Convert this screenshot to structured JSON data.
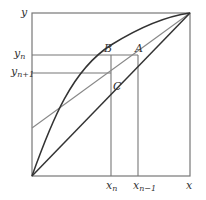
{
  "diagram": {
    "type": "McCabe-Thiele style equilibrium / operating line construction",
    "axes": {
      "x_label": "x",
      "y_label": "y"
    },
    "horizontal_levels": [
      {
        "label": "y",
        "sub": "n",
        "id": "y_n"
      },
      {
        "label": "y",
        "sub": "n+1",
        "id": "y_n_plus_1"
      }
    ],
    "vertical_levels": [
      {
        "label": "x",
        "sub": "n",
        "id": "x_n"
      },
      {
        "label": "x",
        "sub": "n−1",
        "id": "x_n_minus_1"
      }
    ],
    "points": [
      {
        "label": "A"
      },
      {
        "label": "B"
      },
      {
        "label": "C"
      }
    ],
    "curves": [
      {
        "name": "equilibrium-curve",
        "description": "concave curve from origin to top-right"
      },
      {
        "name": "diagonal-line",
        "description": "y = x diagonal from origin to top-right"
      },
      {
        "name": "operating-line",
        "description": "grey straight line from left axis to top-right"
      }
    ],
    "colors": {
      "frame": "#777777",
      "curve": "#333333",
      "operating_line": "#888888",
      "label": "#333333"
    }
  }
}
